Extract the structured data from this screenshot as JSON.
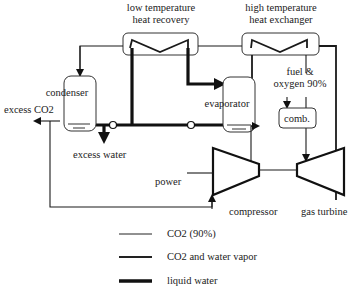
{
  "diagram": {
    "components": {
      "low_temp_hx": {
        "label_line1": "low temperature",
        "label_line2": "heat recovery"
      },
      "high_temp_hx": {
        "label_line1": "high temperature",
        "label_line2": "heat exchanger"
      },
      "condenser": {
        "label": "condenser"
      },
      "evaporator": {
        "label": "evaporator"
      },
      "combustor": {
        "label": "comb."
      },
      "compressor": {
        "label": "compressor"
      },
      "gas_turbine": {
        "label": "gas turbine"
      }
    },
    "streams": {
      "excess_co2": "excess CO2",
      "excess_water": "excess water",
      "fuel_line1": "fuel &",
      "fuel_line2": "oxygen 90%",
      "power": "power"
    },
    "legend": [
      {
        "style": "thin",
        "label": "CO2 (90%)"
      },
      {
        "style": "medium",
        "label": "CO2 and water vapor"
      },
      {
        "style": "thick",
        "label": "liquid water"
      }
    ]
  }
}
